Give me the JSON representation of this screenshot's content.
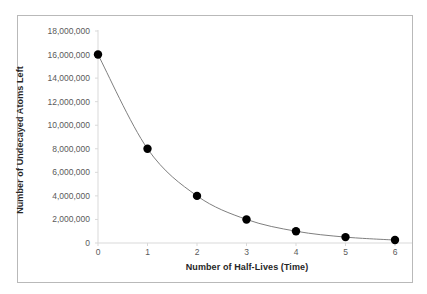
{
  "chart_data": {
    "type": "line",
    "title": "",
    "xlabel": "Number of Half-Lives (Time)",
    "ylabel": "Number of Undecayed Atoms Left",
    "x": [
      0,
      1,
      2,
      3,
      4,
      5,
      6
    ],
    "values": [
      16000000,
      8000000,
      4000000,
      2000000,
      1000000,
      500000,
      250000
    ],
    "series": [
      {
        "name": "Undecayed atoms",
        "values": [
          16000000,
          8000000,
          4000000,
          2000000,
          1000000,
          500000,
          250000
        ]
      }
    ],
    "xlim": [
      0,
      6
    ],
    "ylim": [
      0,
      18000000
    ],
    "x_tick_labels": [
      "0",
      "1",
      "2",
      "3",
      "4",
      "5",
      "6"
    ],
    "y_tick_labels": [
      "0",
      "2,000,000",
      "4,000,000",
      "6,000,000",
      "8,000,000",
      "10,000,000",
      "12,000,000",
      "14,000,000",
      "16,000,000",
      "18,000,000"
    ],
    "y_tick_values": [
      0,
      2000000,
      4000000,
      6000000,
      8000000,
      10000000,
      12000000,
      14000000,
      16000000,
      18000000
    ],
    "grid": false,
    "legend": false,
    "marker": "circle",
    "marker_color": "#000000",
    "line_color": "#7f7f7f",
    "axis_color": "#d9d9d9",
    "border_color": "#b9b9b9",
    "background_color": "#ffffff"
  }
}
